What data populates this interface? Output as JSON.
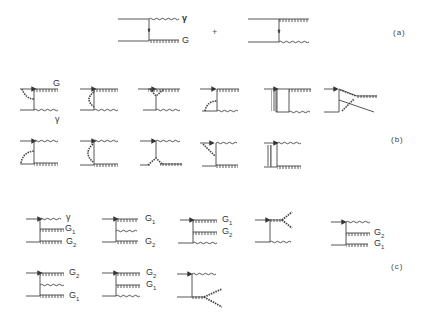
{
  "figure": {
    "panels": [
      {
        "id": "a",
        "label": "(a)",
        "operator": "+"
      },
      {
        "id": "b",
        "label": "(b)"
      },
      {
        "id": "c",
        "label": "(c)"
      }
    ],
    "labels": {
      "a_photon": "γ",
      "a_gluon": "G",
      "b_gluon": "G",
      "b_photon": "γ",
      "c1_photon": "γ",
      "c1_g1": "G",
      "c1_g1_sub": "1",
      "c1_g2": "G",
      "c1_g2_sub": "2",
      "c2_g1": "G",
      "c2_g1_sub": "1",
      "c2_g2": "G",
      "c2_g2_sub": "2",
      "c3_g1": "G",
      "c3_g1_sub": "1",
      "c3_g2": "G",
      "c3_g2_sub": "2",
      "c5_g2": "G",
      "c5_g2_sub": "2",
      "c5_g1": "G",
      "c5_g1_sub": "1",
      "c6_g2": "G",
      "c6_g2_sub": "2",
      "c6_g1": "G",
      "c6_g1_sub": "1",
      "c7_g2": "G",
      "c7_g2_sub": "2",
      "c7_g1": "G",
      "c7_g1_sub": "1"
    },
    "legend": {
      "quark_line": "solid line with arrow",
      "photon": "wavy line",
      "gluon": "curly/hatched line"
    },
    "colors": {
      "ink": "#444444",
      "background": "#ffffff"
    }
  }
}
